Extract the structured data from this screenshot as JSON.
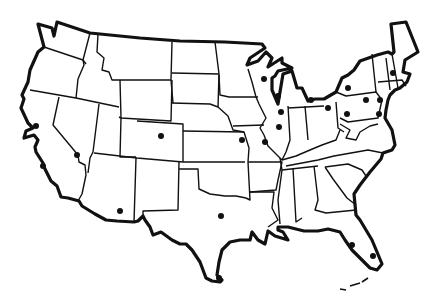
{
  "map": {
    "title": "",
    "subject": "United States state outline map with city markers",
    "colors": {
      "background": "#ffffff",
      "line": "#111111",
      "marker": "#111111"
    },
    "cities": [
      {
        "state": "California",
        "x": 36,
        "y": 126
      },
      {
        "state": "California",
        "x": 43,
        "y": 166
      },
      {
        "state": "Nevada",
        "x": 77,
        "y": 155
      },
      {
        "state": "Colorado",
        "x": 161,
        "y": 136
      },
      {
        "state": "Arizona",
        "x": 120,
        "y": 211
      },
      {
        "state": "Texas",
        "x": 221,
        "y": 216
      },
      {
        "state": "Kansas",
        "x": 242,
        "y": 140
      },
      {
        "state": "Missouri",
        "x": 265,
        "y": 142
      },
      {
        "state": "Wisconsin",
        "x": 264,
        "y": 79
      },
      {
        "state": "Illinois",
        "x": 278,
        "y": 96
      },
      {
        "state": "Illinois",
        "x": 281,
        "y": 112
      },
      {
        "state": "Illinois",
        "x": 279,
        "y": 127
      },
      {
        "state": "Michigan",
        "x": 311,
        "y": 100
      },
      {
        "state": "Ohio",
        "x": 328,
        "y": 108
      },
      {
        "state": "New York",
        "x": 348,
        "y": 88
      },
      {
        "state": "Pennsylvania",
        "x": 366,
        "y": 100
      },
      {
        "state": "Pennsylvania",
        "x": 347,
        "y": 114
      },
      {
        "state": "New York",
        "x": 380,
        "y": 100
      },
      {
        "state": "New Jersey",
        "x": 379,
        "y": 114
      },
      {
        "state": "Massachusetts",
        "x": 393,
        "y": 73
      },
      {
        "state": "Texas",
        "x": 219,
        "y": 278
      },
      {
        "state": "Florida",
        "x": 352,
        "y": 245
      },
      {
        "state": "Florida",
        "x": 373,
        "y": 256
      }
    ]
  }
}
